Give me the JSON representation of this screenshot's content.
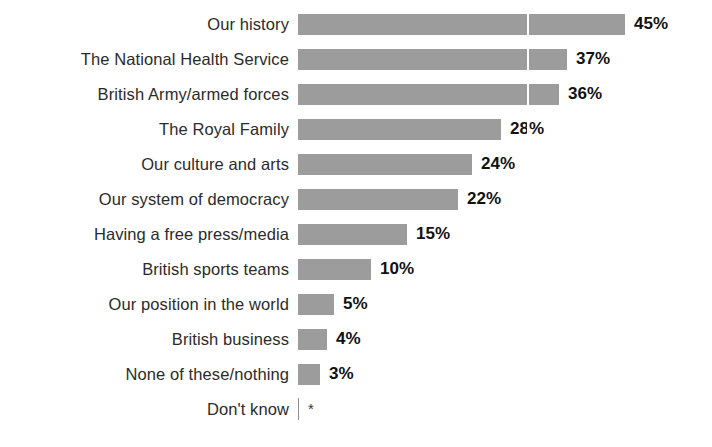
{
  "chart_data": {
    "type": "bar",
    "orientation": "horizontal",
    "title": "",
    "subtitle": "",
    "xlabel": "",
    "ylabel": "",
    "xlim": [
      0,
      45
    ],
    "grid": true,
    "gridline_value": 31,
    "legend": "none",
    "categories": [
      "Our history",
      "The National Health Service",
      "British Army/armed forces",
      "The Royal Family",
      "Our culture and arts",
      "Our system of democracy",
      "Having a free press/media",
      "British sports teams",
      "Our position in the world",
      "British business",
      "None of these/nothing",
      "Don't know"
    ],
    "values": [
      45,
      37,
      36,
      28,
      24,
      22,
      15,
      10,
      5,
      4,
      3,
      null
    ],
    "value_labels": [
      "45%",
      "37%",
      "36%",
      "28%",
      "24%",
      "22%",
      "15%",
      "10%",
      "5%",
      "4%",
      "3%",
      "*"
    ],
    "bar_color": "#9c9c9c",
    "label_color": "#2b2b2b",
    "value_color": "#111111",
    "background": "#ffffff"
  }
}
